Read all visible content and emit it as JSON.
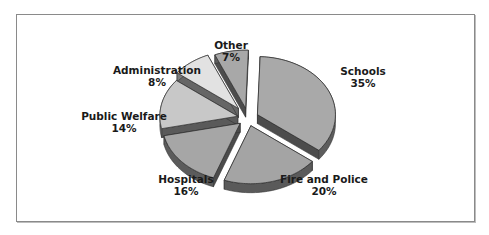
{
  "chart_data": {
    "type": "pie",
    "style": "3d-exploded",
    "title": "",
    "categories": [
      "Schools",
      "Fire and Police",
      "Hospitals",
      "Public Welfare",
      "Administration",
      "Other"
    ],
    "values": [
      35,
      20,
      16,
      14,
      8,
      7
    ],
    "unit": "%",
    "labels": [
      {
        "name": "Schools",
        "value": "35%"
      },
      {
        "name": "Fire and Police",
        "value": "20%"
      },
      {
        "name": "Hospitals",
        "value": "16%"
      },
      {
        "name": "Public Welfare",
        "value": "14%"
      },
      {
        "name": "Administration",
        "value": "8%"
      },
      {
        "name": "Other",
        "value": "7%"
      }
    ],
    "colors": {
      "Schools": "#a9a9a9",
      "Fire and Police": "#a4a4a4",
      "Hospitals": "#a6a6a6",
      "Public Welfare": "#c8c8c8",
      "Administration": "#e2e2e2",
      "Other": "#a8a8a8"
    },
    "legend": "none",
    "grid": false
  }
}
